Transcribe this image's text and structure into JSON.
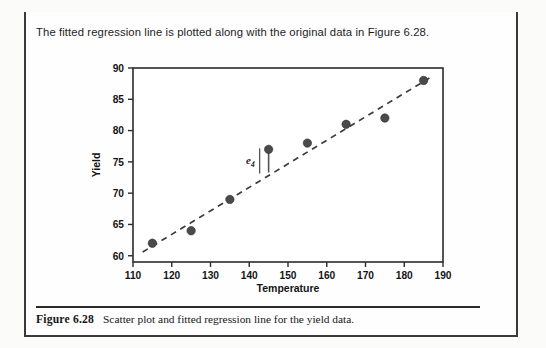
{
  "page": {
    "intro_text": "The fitted regression line is plotted along with the original data in Figure 6.28.",
    "caption_label": "Figure 6.28",
    "caption_text": "Scatter plot and fitted regression line for the yield data."
  },
  "chart_data": {
    "type": "scatter",
    "title": "",
    "xlabel": "Temperature",
    "ylabel": "Yield",
    "xlim": [
      110,
      190
    ],
    "ylim": [
      59,
      90
    ],
    "xticks": [
      110,
      120,
      130,
      140,
      150,
      160,
      170,
      180,
      190
    ],
    "yticks": [
      60,
      65,
      70,
      75,
      80,
      85,
      90
    ],
    "grid": false,
    "legend": null,
    "marker_color": "#4a4a4a",
    "line_color": "#3c3c3c",
    "axis_color": "#2b2b2b",
    "x": [
      115,
      125,
      135,
      145,
      155,
      165,
      175,
      185
    ],
    "y": [
      62,
      64,
      69,
      77,
      78,
      81,
      82,
      88
    ],
    "points": [
      {
        "x": 115,
        "y": 62
      },
      {
        "x": 125,
        "y": 64
      },
      {
        "x": 135,
        "y": 69
      },
      {
        "x": 145,
        "y": 77
      },
      {
        "x": 155,
        "y": 78
      },
      {
        "x": 165,
        "y": 81
      },
      {
        "x": 175,
        "y": 82
      },
      {
        "x": 185,
        "y": 88
      }
    ],
    "fit_line": {
      "style": "dashed",
      "x_start": 112.5,
      "y_start": 60.6,
      "x_end": 186.5,
      "y_end": 88.4
    },
    "annotations": [
      {
        "label": "e",
        "subscript": "4",
        "type": "residual",
        "at_x": 145,
        "from_y": 73.3,
        "to_y": 77
      }
    ]
  }
}
